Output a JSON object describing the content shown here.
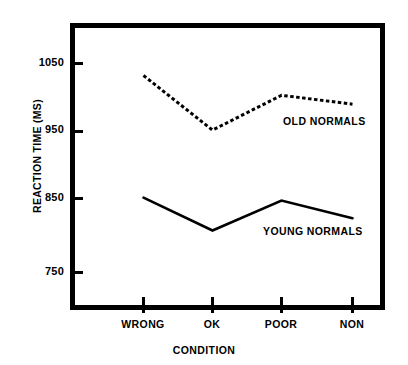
{
  "chart_data": {
    "type": "line",
    "title": "",
    "xlabel": "CONDITION",
    "ylabel": "REACTION TIME (MS)",
    "categories": [
      "WRONG",
      "OK",
      "POOR",
      "NON"
    ],
    "ylim": [
      700,
      1075
    ],
    "yticks": [
      750,
      850,
      950,
      1050
    ],
    "ytick_labels": [
      "750",
      "850",
      "950",
      "1050"
    ],
    "grid": false,
    "legend_position": "inline-annotation",
    "series": [
      {
        "name": "OLD NORMALS",
        "style": "dashed",
        "color": "#000000",
        "values": [
          1031,
          951,
          1002,
          989
        ]
      },
      {
        "name": "YOUNG NORMALS",
        "style": "solid",
        "color": "#000000",
        "values": [
          852,
          804,
          848,
          822
        ]
      }
    ],
    "annotations": [
      {
        "text": "OLD NORMALS",
        "series": "OLD NORMALS"
      },
      {
        "text": "YOUNG NORMALS",
        "series": "YOUNG NORMALS"
      }
    ]
  },
  "axis": {
    "y_title": "REACTION TIME (MS)",
    "x_title": "CONDITION",
    "y_tick_labels": [
      "1050",
      "950",
      "850",
      "750"
    ],
    "x_tick_labels": [
      "WRONG",
      "OK",
      "POOR",
      "NON"
    ]
  },
  "colors": {
    "frame": "#000000",
    "background": "#ffffff",
    "ink": "#000000"
  }
}
